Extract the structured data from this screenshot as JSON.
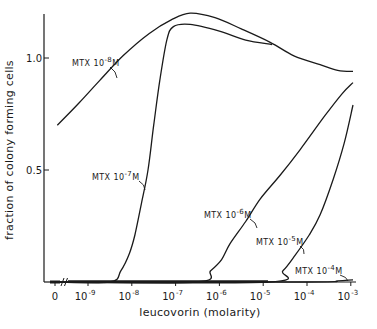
{
  "chart_data": {
    "type": "line",
    "title": "",
    "xlabel": "leucovorin (molarity)",
    "ylabel": "fraction of colony forming cells",
    "x_scale": "log10",
    "x_ticks": [
      {
        "label": "0",
        "value": null
      },
      {
        "label": "10",
        "exp": "-9",
        "value": -9
      },
      {
        "label": "10",
        "exp": "-8",
        "value": -8
      },
      {
        "label": "10",
        "exp": "-7",
        "value": -7
      },
      {
        "label": "10",
        "exp": "-6",
        "value": -6
      },
      {
        "label": "10",
        "exp": "-5",
        "value": -5
      },
      {
        "label": "10",
        "exp": "-4",
        "value": -4
      },
      {
        "label": "10",
        "exp": "-3",
        "value": -3
      }
    ],
    "y_ticks": [
      {
        "label": "0.5",
        "value": 0.5
      },
      {
        "label": "1.0",
        "value": 1.0
      }
    ],
    "ylim": [
      0,
      1.2
    ],
    "xlim_log10": [
      -9.75,
      -2.95
    ],
    "grid": false,
    "axis_break": "//",
    "series": [
      {
        "name": "MTX 10^-8 M",
        "label_base": "MTX 10",
        "label_exp": "-8",
        "label_unit": "M",
        "points": [
          [
            -9.7,
            0.7
          ],
          [
            -9.2,
            0.8
          ],
          [
            -8.73,
            0.9
          ],
          [
            -8.2,
            1.01
          ],
          [
            -7.6,
            1.11
          ],
          [
            -7.1,
            1.17
          ],
          [
            -6.67,
            1.2
          ],
          [
            -6.1,
            1.18
          ],
          [
            -5.5,
            1.13
          ],
          [
            -4.84,
            1.07
          ],
          [
            -4.3,
            1.01
          ],
          [
            -3.7,
            0.97
          ],
          [
            -3.3,
            0.945
          ],
          [
            -2.95,
            0.94
          ]
        ]
      },
      {
        "name": "MTX 10^-7 M",
        "label_base": "MTX 10",
        "label_exp": "-7",
        "label_unit": "M",
        "points": [
          [
            -9.75,
            0.0
          ],
          [
            -8.5,
            0.0
          ],
          [
            -8.25,
            0.05
          ],
          [
            -8.05,
            0.13
          ],
          [
            -7.93,
            0.21
          ],
          [
            -7.78,
            0.35
          ],
          [
            -7.63,
            0.5
          ],
          [
            -7.5,
            0.7
          ],
          [
            -7.36,
            0.9
          ],
          [
            -7.2,
            1.08
          ],
          [
            -7.05,
            1.14
          ],
          [
            -6.67,
            1.15
          ],
          [
            -6.0,
            1.12
          ],
          [
            -5.4,
            1.08
          ],
          [
            -4.8,
            1.06
          ]
        ]
      },
      {
        "name": "MTX 10^-6 M",
        "label_base": "MTX 10",
        "label_exp": "-6",
        "label_unit": "M",
        "points": [
          [
            -9.75,
            0.0
          ],
          [
            -6.53,
            0.0
          ],
          [
            -6.2,
            0.05
          ],
          [
            -5.95,
            0.1
          ],
          [
            -5.76,
            0.17
          ],
          [
            -5.4,
            0.27
          ],
          [
            -5.07,
            0.37
          ],
          [
            -4.6,
            0.48
          ],
          [
            -4.16,
            0.59
          ],
          [
            -3.6,
            0.74
          ],
          [
            -3.2,
            0.84
          ],
          [
            -2.95,
            0.89
          ]
        ]
      },
      {
        "name": "MTX 10^-5 M",
        "label_base": "MTX 10",
        "label_exp": "-5",
        "label_unit": "M",
        "points": [
          [
            -9.75,
            0.0
          ],
          [
            -4.89,
            0.0
          ],
          [
            -4.55,
            0.05
          ],
          [
            -4.27,
            0.12
          ],
          [
            -3.95,
            0.21
          ],
          [
            -3.7,
            0.3
          ],
          [
            -3.4,
            0.46
          ],
          [
            -3.15,
            0.62
          ],
          [
            -2.95,
            0.79
          ]
        ]
      },
      {
        "name": "MTX 10^-4 M",
        "label_base": "MTX 10",
        "label_exp": "-4",
        "label_unit": "M",
        "points": [
          [
            -9.75,
            0.0
          ],
          [
            -4.0,
            0.0
          ],
          [
            -3.3,
            0.005
          ],
          [
            -2.95,
            0.01
          ]
        ]
      }
    ],
    "legend": "inline labels with leader ticks on each curve"
  }
}
